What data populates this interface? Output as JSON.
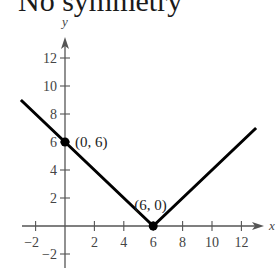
{
  "title": "No symmetry",
  "chart_data": {
    "type": "line",
    "title": "No symmetry",
    "xlabel": "x",
    "ylabel": "y",
    "xlim": [
      -3,
      14
    ],
    "ylim": [
      -3,
      14
    ],
    "x_ticks": [
      -2,
      2,
      4,
      6,
      8,
      10,
      12
    ],
    "y_ticks": [
      -2,
      2,
      4,
      6,
      8,
      10,
      12
    ],
    "grid": false,
    "series": [
      {
        "name": "y = |x - 6|",
        "x": [
          -3,
          0,
          6,
          13
        ],
        "y": [
          9,
          6,
          0,
          7
        ],
        "color": "#000000"
      }
    ],
    "annotations": [
      {
        "label": "(0, 6)",
        "x": 0,
        "y": 6
      },
      {
        "label": "(6, 0)",
        "x": 6,
        "y": 0
      }
    ]
  },
  "colors": {
    "axis": "#555555",
    "line": "#000000"
  }
}
